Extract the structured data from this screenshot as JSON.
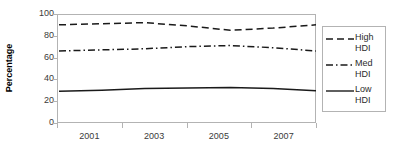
{
  "chart_data": {
    "type": "line",
    "title": "",
    "xlabel": "",
    "ylabel": "Percentage",
    "ylim": [
      0,
      100
    ],
    "ytick_labels": [
      "100",
      "80",
      "60",
      "40",
      "20",
      "0"
    ],
    "ytick_values": [
      100,
      80,
      60,
      40,
      20,
      0
    ],
    "x": [
      2001,
      2002,
      2003,
      2004,
      2005,
      2006,
      2007
    ],
    "xtick_labels": [
      "2001",
      "2003",
      "2005",
      "2007"
    ],
    "grid": false,
    "legend_position": "right",
    "series": [
      {
        "name": "High HDI",
        "label_line1": "High",
        "label_line2": "HDI",
        "style": "dashed",
        "color": "#1a1a1a",
        "values": [
          91,
          92,
          93,
          90,
          86,
          88,
          91
        ]
      },
      {
        "name": "Med HDI",
        "label_line1": "Med",
        "label_line2": "HDI",
        "style": "dash-dot",
        "color": "#1a1a1a",
        "values": [
          67,
          68,
          69,
          71,
          72,
          70,
          67
        ]
      },
      {
        "name": "Low HDI",
        "label_line1": "Low",
        "label_line2": "HDI",
        "style": "solid",
        "color": "#1a1a1a",
        "values": [
          30,
          31,
          32.5,
          33,
          33.5,
          32.5,
          30.5
        ]
      }
    ]
  },
  "axis": {
    "y_title": "Percentage"
  }
}
